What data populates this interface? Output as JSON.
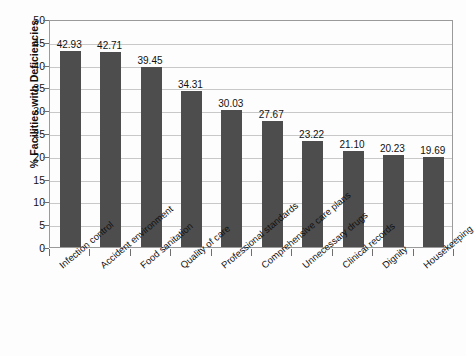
{
  "chart_data": {
    "type": "bar",
    "title": "",
    "xlabel": "",
    "ylabel": "% Facilities with Deficiencies",
    "ylim": [
      0,
      50
    ],
    "ytick_step": 5,
    "yticks": [
      "0",
      "5",
      "10",
      "15",
      "20",
      "25",
      "30",
      "35",
      "40",
      "45",
      "50"
    ],
    "grid": "horizontal",
    "legend": "none",
    "bar_color": "#4d4d4d",
    "gridline_color": "#c8c8c8",
    "plot_border_color": "#9a9a9a",
    "background_color": "#fdfdfd",
    "categories": [
      "Infection control",
      "Accident environment",
      "Food sanitation",
      "Quality of care",
      "Professional standards",
      "Comprehensive care plans",
      "Unnecessary drugs",
      "Clinical records",
      "Dignity",
      "Housekeeping"
    ],
    "values": [
      42.93,
      42.71,
      39.45,
      34.31,
      30.03,
      27.67,
      23.22,
      21.1,
      20.23,
      19.69
    ],
    "data_labels": [
      "42.93",
      "42.71",
      "39.45",
      "34.31",
      "30.03",
      "27.67",
      "23.22",
      "21.10",
      "20.23",
      "19.69"
    ]
  }
}
